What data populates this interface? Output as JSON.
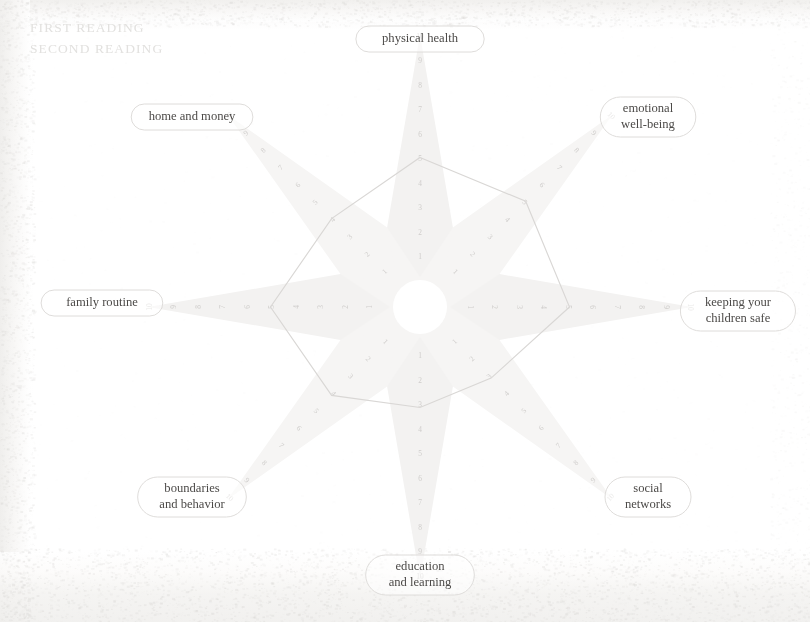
{
  "legend": {
    "first_reading_label": "FIRST READING",
    "second_reading_label": "SECOND READING"
  },
  "colors": {
    "ray_fill": "#f3f2f1",
    "ray_fill_alt": "#f6f5f4",
    "polygon_stroke": "#d9d7d5",
    "pill_stroke": "#dedcda",
    "label_text": "#4c4a48",
    "axis_number": "#cfcdcb",
    "legend_text": "#e2e1df",
    "page_background": "#ffffff"
  },
  "chart_data": {
    "type": "radar",
    "title": "",
    "subtitle": "",
    "xlabel": "",
    "ylabel": "",
    "scale_min": 1,
    "scale_max": 10,
    "tick_labels": [
      "1",
      "2",
      "3",
      "4",
      "5",
      "6",
      "7",
      "8",
      "9",
      "10"
    ],
    "grid": false,
    "legend_position": "top-left",
    "categories": [
      "physical health",
      "emotional well-being",
      "keeping your children safe",
      "social networks",
      "education and learning",
      "boundaries and behavior",
      "family routine",
      "home and money"
    ],
    "series": [
      {
        "name": "FIRST READING",
        "values": [
          5,
          5,
          5,
          3,
          3,
          4,
          5,
          4
        ]
      }
    ],
    "annotations": []
  },
  "axis_labels": [
    {
      "id": "physical-health",
      "text_lines": [
        "physical health"
      ]
    },
    {
      "id": "emotional-well-being",
      "text_lines": [
        "emotional",
        "well-being"
      ]
    },
    {
      "id": "keeping-your-children-safe",
      "text_lines": [
        "keeping your",
        "children safe"
      ]
    },
    {
      "id": "social-networks",
      "text_lines": [
        "social",
        "networks"
      ]
    },
    {
      "id": "education-and-learning",
      "text_lines": [
        "education",
        "and learning"
      ]
    },
    {
      "id": "boundaries-and-behavior",
      "text_lines": [
        "boundaries",
        "and behavior"
      ]
    },
    {
      "id": "family-routine",
      "text_lines": [
        "family routine"
      ]
    },
    {
      "id": "home-and-money",
      "text_lines": [
        "home and money"
      ]
    }
  ]
}
